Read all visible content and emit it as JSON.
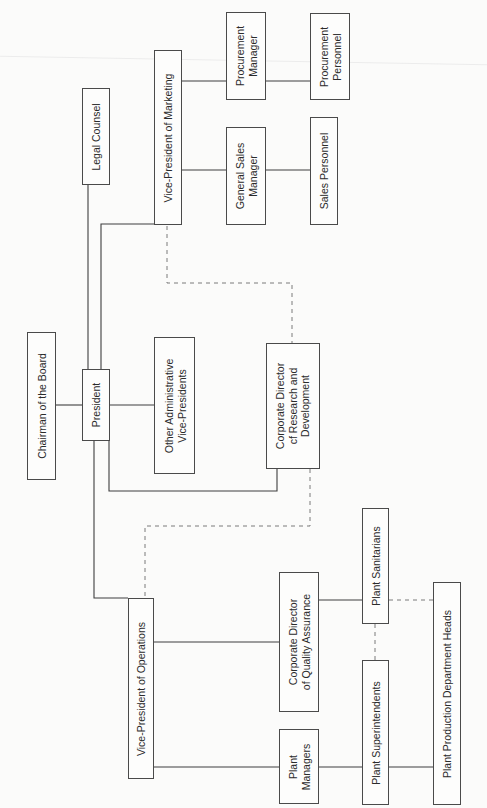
{
  "diagram": {
    "type": "organization-chart",
    "orientation": "rotated-90-ccw",
    "nodes": [
      {
        "id": "chairman",
        "label": "Chairman of the Board"
      },
      {
        "id": "president",
        "label": "President"
      },
      {
        "id": "legal",
        "label": "Legal Counsel"
      },
      {
        "id": "vp_marketing",
        "label": "Vice-President of Marketing"
      },
      {
        "id": "procurement_mgr",
        "label": "Procurement\nManager"
      },
      {
        "id": "procurement_personnel",
        "label": "Procurement\nPersonnel"
      },
      {
        "id": "general_sales_mgr",
        "label": "General Sales\nManager"
      },
      {
        "id": "sales_personnel",
        "label": "Sales Personnel"
      },
      {
        "id": "other_admin_vps",
        "label": "Other Administrative\nVice-Presidents"
      },
      {
        "id": "rd_director",
        "label": "Corporate Director\ncf Research and\nDevelopment"
      },
      {
        "id": "vp_operations",
        "label": "Vice-President of Operations"
      },
      {
        "id": "qa_director",
        "label": "Corporate Director\nof Quality Assurance"
      },
      {
        "id": "plant_managers",
        "label": "Plant\nManagers"
      },
      {
        "id": "plant_sanitarians",
        "label": "Plant Sanitarians"
      },
      {
        "id": "plant_superintendents",
        "label": "Plant Superintendents"
      },
      {
        "id": "plant_prod_heads",
        "label": "Plant Production Department Heads"
      }
    ],
    "edges_solid": [
      [
        "chairman",
        "president"
      ],
      [
        "president",
        "legal"
      ],
      [
        "president",
        "vp_marketing"
      ],
      [
        "president",
        "other_admin_vps"
      ],
      [
        "president",
        "rd_director"
      ],
      [
        "president",
        "vp_operations"
      ],
      [
        "vp_marketing",
        "procurement_mgr"
      ],
      [
        "procurement_mgr",
        "procurement_personnel"
      ],
      [
        "vp_marketing",
        "general_sales_mgr"
      ],
      [
        "general_sales_mgr",
        "sales_personnel"
      ],
      [
        "vp_operations",
        "qa_director"
      ],
      [
        "vp_operations",
        "plant_managers"
      ],
      [
        "qa_director",
        "plant_sanitarians"
      ],
      [
        "plant_managers",
        "plant_superintendents"
      ],
      [
        "plant_superintendents",
        "plant_prod_heads"
      ]
    ],
    "edges_dashed": [
      [
        "vp_marketing",
        "rd_director"
      ],
      [
        "rd_director",
        "vp_operations"
      ],
      [
        "plant_sanitarians",
        "plant_superintendents"
      ],
      [
        "plant_sanitarians",
        "plant_prod_heads"
      ]
    ],
    "colors": {
      "line": "#3e3e3e",
      "dashed_line": "#7a7a7a",
      "background": "#fbfbfa",
      "box_border": "#4a4a4a"
    }
  }
}
